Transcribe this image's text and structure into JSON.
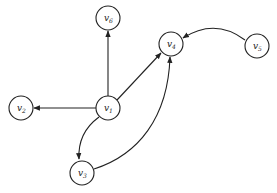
{
  "diagram": {
    "type": "directed-graph",
    "nodes": [
      {
        "id": "v1",
        "base": "v",
        "sub": "1",
        "x": 108,
        "y": 108
      },
      {
        "id": "v2",
        "base": "v",
        "sub": "2",
        "x": 21,
        "y": 108
      },
      {
        "id": "v3",
        "base": "v",
        "sub": "3",
        "x": 82,
        "y": 173
      },
      {
        "id": "v4",
        "base": "v",
        "sub": "4",
        "x": 171,
        "y": 44
      },
      {
        "id": "v5",
        "base": "v",
        "sub": "5",
        "x": 257,
        "y": 46
      },
      {
        "id": "v6",
        "base": "v",
        "sub": "6",
        "x": 108,
        "y": 18
      }
    ],
    "edges": [
      {
        "from": "v1",
        "to": "v6",
        "shape": "straight"
      },
      {
        "from": "v1",
        "to": "v2",
        "shape": "straight"
      },
      {
        "from": "v1",
        "to": "v4",
        "shape": "straight"
      },
      {
        "from": "v1",
        "to": "v3",
        "shape": "curved"
      },
      {
        "from": "v3",
        "to": "v4",
        "shape": "curved"
      },
      {
        "from": "v5",
        "to": "v4",
        "shape": "curved"
      }
    ]
  }
}
